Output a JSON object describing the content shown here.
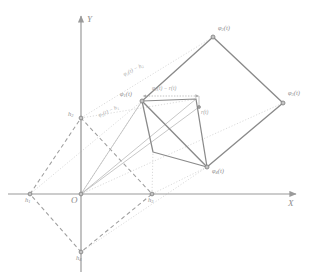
{
  "figure": {
    "background_color": "#ffffff",
    "stroke_colors": {
      "axis": "#9a9a9a",
      "solid_quad": "#8d8d8d",
      "dashed_quad": "#9e9e9e",
      "dotted_guide": "#c9c9c9",
      "thin_vector": "#b0b0b0",
      "marker_fill": "#b8b8b8",
      "marker_stroke": "#7d7d7d",
      "text": "#8d8d8d"
    },
    "axes": {
      "x_label": "X",
      "y_label": "Y",
      "origin_label": "O"
    },
    "outer_quad": {
      "name": "outer-solid-quadrilateral",
      "vertices": [
        {
          "id": "phi2",
          "label": "φ",
          "sub": "2",
          "suffix": "(t)",
          "x": 213,
          "y": 37
        },
        {
          "id": "phi3",
          "label": "φ",
          "sub": "3",
          "suffix": "(t)",
          "x": 283,
          "y": 103
        },
        {
          "id": "phi4",
          "label": "φ",
          "sub": "4",
          "suffix": "(t)",
          "x": 207,
          "y": 167
        },
        {
          "id": "phi1",
          "label": "φ",
          "sub": "1",
          "suffix": "(t)",
          "x": 142,
          "y": 101
        }
      ]
    },
    "inner_quad": {
      "name": "inner-solid-quadrilateral",
      "vertices": [
        {
          "x": 142,
          "y": 101
        },
        {
          "x": 196,
          "y": 99
        },
        {
          "x": 207,
          "y": 167
        },
        {
          "x": 153,
          "y": 152
        }
      ]
    },
    "dashed_quad": {
      "name": "dashed-reference-quadrilateral",
      "vertices": [
        {
          "id": "h2",
          "label": "h",
          "sub": "2",
          "suffix": "",
          "x": 81,
          "y": 118
        },
        {
          "id": "h3",
          "label": "h",
          "sub": "3",
          "suffix": "",
          "x": 152,
          "y": 194
        },
        {
          "id": "h4",
          "label": "h",
          "sub": "4",
          "suffix": "",
          "x": 81,
          "y": 252
        },
        {
          "id": "h1",
          "label": "h",
          "sub": "1",
          "suffix": "",
          "x": 30,
          "y": 194
        }
      ]
    },
    "points": {
      "origin": {
        "x": 81,
        "y": 194
      },
      "r_center": {
        "x": 199,
        "y": 107
      },
      "phi1_point": {
        "x": 142,
        "y": 101
      }
    },
    "vector_labels": [
      {
        "id": "phi-minus-r",
        "text": "φ₁(t) − r(t)",
        "display": "φ",
        "sub": "1",
        "rest": "(t) − r(t)",
        "x": 152,
        "y": 82
      },
      {
        "id": "r-of-t",
        "text": "r(t)",
        "display": "r(t)",
        "x": 201,
        "y": 112
      }
    ],
    "diagonal_labels": [
      {
        "id": "phi2-minus-h2",
        "display": "φ",
        "sub": "2",
        "rest": "(t) − h",
        "sub2": "2",
        "x": 126,
        "y": 74,
        "rotate": -26
      },
      {
        "id": "phi1-minus-h1",
        "display": "φ",
        "sub": "1",
        "rest": "(t) − h",
        "sub2": "1",
        "x": 100,
        "y": 114,
        "rotate": -24
      }
    ],
    "markers": [
      {
        "name": "vertex-marker-phi2",
        "x": 213,
        "y": 37
      },
      {
        "name": "vertex-marker-phi3",
        "x": 283,
        "y": 103
      },
      {
        "name": "vertex-marker-phi4",
        "x": 207,
        "y": 167
      },
      {
        "name": "vertex-marker-phi1",
        "x": 142,
        "y": 101
      },
      {
        "name": "vertex-marker-inner-top",
        "x": 196,
        "y": 99
      },
      {
        "name": "vertex-marker-inner-bottom",
        "x": 153,
        "y": 152
      },
      {
        "name": "point-marker-origin",
        "x": 81,
        "y": 194
      },
      {
        "name": "point-marker-h1",
        "x": 30,
        "y": 194
      },
      {
        "name": "point-marker-h2",
        "x": 81,
        "y": 118
      },
      {
        "name": "point-marker-h3",
        "x": 152,
        "y": 194
      },
      {
        "name": "point-marker-h4",
        "x": 81,
        "y": 252
      },
      {
        "name": "point-marker-r-center",
        "x": 199,
        "y": 107
      }
    ]
  }
}
